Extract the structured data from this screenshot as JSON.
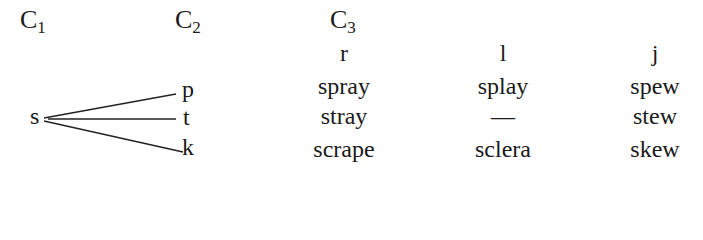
{
  "headers": {
    "c1": {
      "letter": "C",
      "sub": "1"
    },
    "c2": {
      "letter": "C",
      "sub": "2"
    },
    "c3": {
      "letter": "C",
      "sub": "3"
    }
  },
  "subheaders": [
    "r",
    "l",
    "j"
  ],
  "c1_value": "s",
  "c2_values": [
    "p",
    "t",
    "k"
  ],
  "rows": [
    [
      "spray",
      "splay",
      "spew"
    ],
    [
      "stray",
      "—",
      "stew"
    ],
    [
      "scrape",
      "sclera",
      "skew"
    ]
  ]
}
